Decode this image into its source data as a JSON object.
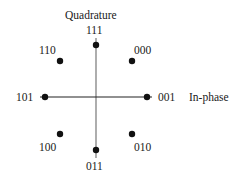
{
  "diagram": {
    "type": "constellation",
    "axes": {
      "vertical_label": "Quadrature",
      "horizontal_label": "In-phase"
    },
    "points": [
      {
        "bits": "111",
        "x": 96,
        "y": 45
      },
      {
        "bits": "000",
        "x": 132,
        "y": 61
      },
      {
        "bits": "001",
        "x": 147,
        "y": 97
      },
      {
        "bits": "010",
        "x": 132,
        "y": 134
      },
      {
        "bits": "011",
        "x": 96,
        "y": 150
      },
      {
        "bits": "100",
        "x": 60,
        "y": 134
      },
      {
        "bits": "101",
        "x": 45,
        "y": 97
      },
      {
        "bits": "110",
        "x": 60,
        "y": 61
      }
    ],
    "colors": {
      "point": "#111111",
      "horizontal_axis": "#222222",
      "vertical_axis": "#777777"
    }
  }
}
